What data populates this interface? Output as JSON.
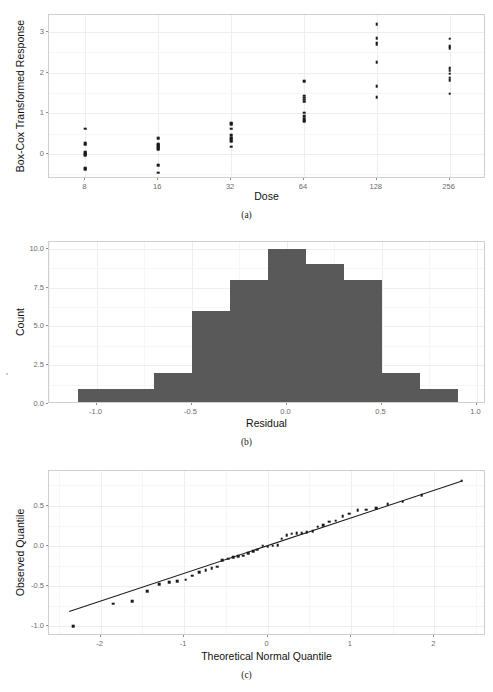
{
  "document": {
    "type": "figure-page",
    "background_color": "#ffffff",
    "partial_text_top": "",
    "captions": [
      {
        "id": "caption-a",
        "text": "(a)"
      },
      {
        "id": "caption-b",
        "text": "(b)"
      },
      {
        "id": "caption-c",
        "text": "(c)"
      }
    ]
  },
  "colors": {
    "point": "#1a1a1a",
    "bar_fill": "#595959",
    "panel_border": "#cfcfcf",
    "gridline": "#eceff1",
    "gridline_minor": "#f4f6f7",
    "axis_text": "#6b6b6b",
    "axis_title": "#111111"
  },
  "chart_data": [
    {
      "id": "panel-a",
      "type": "scatter",
      "title": "",
      "xlabel": "Dose",
      "ylabel": "Box-Cox Transformed Response",
      "x_tick_labels": [
        "8",
        "16",
        "32",
        "64",
        "128",
        "256"
      ],
      "x_tick_values": [
        8,
        16,
        32,
        64,
        128,
        256
      ],
      "x_scale": "log2-category",
      "y_tick_labels": [
        "0",
        "1",
        "2",
        "3"
      ],
      "y_tick_values": [
        0,
        1,
        2,
        3
      ],
      "ylim": [
        -0.62,
        3.42
      ],
      "grid": true,
      "legend": "none",
      "series": [
        {
          "name": "Dose 8",
          "x": 8,
          "values": [
            0.62,
            0.26,
            0.23,
            0.05,
            0.02,
            -0.01,
            -0.04,
            -0.35,
            -0.38
          ]
        },
        {
          "name": "Dose 16",
          "x": 16,
          "values": [
            0.39,
            0.24,
            0.21,
            0.17,
            0.14,
            0.1,
            -0.28,
            -0.46
          ]
        },
        {
          "name": "Dose 32",
          "x": 32,
          "values": [
            0.76,
            0.73,
            0.62,
            0.46,
            0.4,
            0.37,
            0.34,
            0.3,
            0.18
          ]
        },
        {
          "name": "Dose 64",
          "x": 64,
          "values": [
            1.79,
            1.43,
            1.38,
            1.33,
            1.28,
            1.01,
            0.93,
            0.86,
            0.81
          ]
        },
        {
          "name": "Dose 128",
          "x": 128,
          "values": [
            3.2,
            2.85,
            2.74,
            2.7,
            2.26,
            1.66,
            1.4
          ]
        },
        {
          "name": "Dose 256",
          "x": 256,
          "values": [
            2.84,
            2.65,
            2.6,
            2.11,
            2.05,
            1.97,
            1.88,
            1.82,
            1.48
          ]
        }
      ]
    },
    {
      "id": "panel-b",
      "type": "bar",
      "subtype": "histogram",
      "title": "",
      "xlabel": "Residual",
      "ylabel": "Count",
      "x_tick_labels": [
        "-1.0",
        "-0.5",
        "0.0",
        "0.5",
        "1.0"
      ],
      "x_tick_values": [
        -1.0,
        -0.5,
        0.0,
        0.5,
        1.0
      ],
      "y_tick_labels": [
        "0.0",
        "2.5",
        "5.0",
        "7.5",
        "10.0"
      ],
      "y_tick_values": [
        0.0,
        2.5,
        5.0,
        7.5,
        10.0
      ],
      "xlim": [
        -1.25,
        1.05
      ],
      "ylim": [
        0,
        10.45
      ],
      "bin_width": 0.2,
      "bin_edges": [
        -1.1,
        -0.9,
        -0.7,
        -0.5,
        -0.3,
        -0.1,
        0.1,
        0.3,
        0.5,
        0.7,
        0.9
      ],
      "categories": [
        "-1.1..-0.9",
        "-0.9..-0.7",
        "-0.7..-0.5",
        "-0.5..-0.3",
        "-0.3..-0.1",
        "-0.1..0.1",
        "0.1..0.3",
        "0.3..0.5",
        "0.5..0.7",
        "0.7..0.9"
      ],
      "values": [
        1,
        1,
        2,
        6,
        8,
        10,
        9,
        8,
        2,
        1
      ],
      "grid": true,
      "legend": "none"
    },
    {
      "id": "panel-c",
      "type": "scatter",
      "subtype": "qq-plot",
      "title": "",
      "xlabel": "Theoretical Normal Quantile",
      "ylabel": "Observed Quantile",
      "x_tick_labels": [
        "-2",
        "-1",
        "0",
        "1",
        "2"
      ],
      "x_tick_values": [
        -2,
        -1,
        0,
        1,
        2
      ],
      "y_tick_labels": [
        "-1.0",
        "-0.5",
        "0.0",
        "0.5"
      ],
      "y_tick_values": [
        -1.0,
        -0.5,
        0.0,
        0.5
      ],
      "xlim": [
        -2.62,
        2.62
      ],
      "ylim": [
        -1.12,
        0.93
      ],
      "grid": true,
      "legend": "none",
      "reference_line": {
        "x0": -2.38,
        "y0": -0.805,
        "x1": 2.33,
        "y1": 0.815
      },
      "x": [
        -2.33,
        -1.85,
        -1.62,
        -1.44,
        -1.3,
        -1.18,
        -1.08,
        -0.98,
        -0.9,
        -0.82,
        -0.74,
        -0.67,
        -0.6,
        -0.54,
        -0.47,
        -0.41,
        -0.35,
        -0.29,
        -0.23,
        -0.17,
        -0.12,
        -0.06,
        0.0,
        0.06,
        0.12,
        0.17,
        0.23,
        0.29,
        0.35,
        0.41,
        0.47,
        0.54,
        0.6,
        0.67,
        0.74,
        0.82,
        0.9,
        0.98,
        1.08,
        1.18,
        1.3,
        1.44,
        1.62,
        1.85,
        2.33
      ],
      "y": [
        -1.0,
        -0.72,
        -0.69,
        -0.56,
        -0.48,
        -0.45,
        -0.44,
        -0.42,
        -0.37,
        -0.33,
        -0.3,
        -0.28,
        -0.26,
        -0.18,
        -0.16,
        -0.14,
        -0.13,
        -0.12,
        -0.09,
        -0.07,
        -0.05,
        0.0,
        -0.01,
        0.0,
        0.01,
        0.09,
        0.13,
        0.15,
        0.16,
        0.16,
        0.17,
        0.18,
        0.24,
        0.26,
        0.3,
        0.31,
        0.37,
        0.4,
        0.44,
        0.45,
        0.47,
        0.52,
        0.55,
        0.63,
        0.81
      ]
    }
  ]
}
